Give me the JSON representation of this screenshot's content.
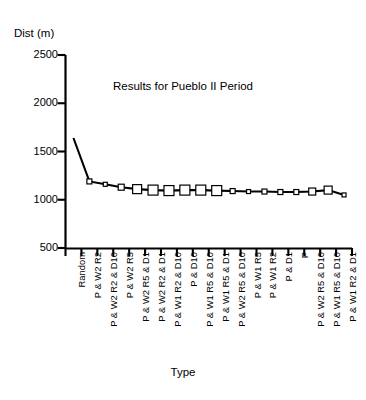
{
  "chart_data": {
    "type": "line",
    "title": "Results for Pueblo II Period",
    "xlabel": "Type",
    "ylabel": "Dist (m)",
    "ylim": [
      500,
      2500
    ],
    "yticks": [
      500,
      1000,
      1500,
      2000,
      2500
    ],
    "grid": false,
    "legend": null,
    "marker": "open-square",
    "categories": [
      "Random",
      "P & W2 R2",
      "P & W2 R2 & D10",
      "P & W2 R5",
      "P & W2 R5 & D1",
      "P & W2 R2 & D1",
      "P & W1 R2 & D10",
      "P & D10",
      "P & W1 R5 & D10",
      "P & W1 R5 & D1",
      "P & W2 R5 & D10",
      "P & W1 R5",
      "P & W1 R2",
      "P & D1",
      "P",
      "P & W2 R5 & D10",
      "P & W1 R5 & D10",
      "P & W1 R2 & D1"
    ],
    "values": [
      1640,
      1190,
      1160,
      1130,
      1110,
      1100,
      1095,
      1100,
      1100,
      1095,
      1090,
      1085,
      1085,
      1080,
      1080,
      1085,
      1100,
      1050
    ],
    "marker_sizes": [
      0,
      5,
      4,
      6,
      9,
      10,
      10,
      10,
      10,
      10,
      5,
      4,
      5,
      5,
      5,
      7,
      8,
      4
    ]
  }
}
